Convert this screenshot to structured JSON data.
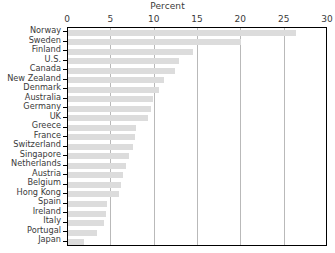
{
  "chart_data": {
    "type": "bar",
    "orientation": "horizontal",
    "title": "Percent",
    "xlabel": "Percent",
    "ylabel": "",
    "xlim": [
      0,
      30
    ],
    "ylim": null,
    "grid": true,
    "legend": null,
    "xticks": [
      0,
      5,
      10,
      15,
      20,
      25,
      30
    ],
    "xtick_labels": [
      "0",
      "5",
      "10",
      "15",
      "20",
      "25",
      "30"
    ],
    "bar_color": "#dcdcdc",
    "frame_color": "#000000",
    "grid_color": "#b9b9b9",
    "text_color": "#3a3a3a",
    "categories": [
      "Norway",
      "Sweden",
      "Finland",
      "U.S.",
      "Canada",
      "New Zealand",
      "Denmark",
      "Australia",
      "Germany",
      "UK",
      "Greece",
      "France",
      "Switzerland",
      "Singapore",
      "Netherlands",
      "Austria",
      "Belgium",
      "Hong Kong",
      "Spain",
      "Ireland",
      "Italy",
      "Portugal",
      "Japan"
    ],
    "values": [
      26.3,
      20.0,
      14.4,
      12.8,
      12.4,
      11.1,
      10.5,
      9.8,
      9.6,
      9.2,
      7.9,
      7.7,
      7.5,
      7.0,
      6.7,
      6.3,
      6.1,
      5.9,
      4.5,
      4.4,
      4.2,
      3.3,
      1.9
    ]
  }
}
